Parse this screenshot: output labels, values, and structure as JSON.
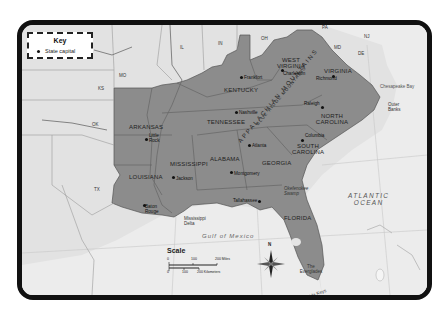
{
  "map": {
    "key": {
      "title": "Key",
      "items": [
        {
          "symbol": "dot",
          "label": "State capital"
        }
      ]
    },
    "states_highlighted": [
      {
        "name": "ARKANSAS",
        "capital": "Little Rock"
      },
      {
        "name": "LOUISIANA",
        "capital": "Baton Rouge"
      },
      {
        "name": "MISSISSIPPI",
        "capital": "Jackson"
      },
      {
        "name": "ALABAMA",
        "capital": "Montgomery"
      },
      {
        "name": "TENNESSEE",
        "capital": "Nashville"
      },
      {
        "name": "KENTUCKY",
        "capital": "Frankfort"
      },
      {
        "name": "GEORGIA",
        "capital": "Atlanta"
      },
      {
        "name": "FLORIDA",
        "capital": "Tallahassee"
      },
      {
        "name": "SOUTH CAROLINA",
        "capital": "Columbia"
      },
      {
        "name": "NORTH CAROLINA",
        "capital": "Raleigh"
      },
      {
        "name": "VIRGINIA",
        "capital": "Richmond"
      },
      {
        "name": "WEST VIRGINIA",
        "capital": "Charleston"
      }
    ],
    "other_states": [
      "MO",
      "KS",
      "OK",
      "TX",
      "IL",
      "IN",
      "OH",
      "PA",
      "MD",
      "DE",
      "NJ"
    ],
    "features": {
      "mountains_1": "APPALACHIAN MOUNTAINS",
      "mountains_2": "BLUE RIDGE MOUNTAINS",
      "bay": "Chesapeake Bay",
      "outer_banks": "Outer Banks",
      "swamp": "Okefenokee Swamp",
      "delta": "Mississippi Delta",
      "everglades": "The Everglades",
      "keys": "Florida Keys",
      "lake": "Lake Okeechobee",
      "gulf": "Gulf of Mexico",
      "ocean_line1": "ATLANTIC",
      "ocean_line2": "OCEAN"
    },
    "scale": {
      "title": "Scale",
      "miles_ticks": [
        "0",
        "100",
        "200 Miles"
      ],
      "km_ticks": [
        "0",
        "100",
        "200 Kilometers"
      ]
    },
    "compass": {
      "north_label": "N"
    },
    "colors": {
      "highlight": "#8a8a8a",
      "land": "#e4e4e4",
      "water": "#eeeeee",
      "border": "#111111"
    }
  }
}
